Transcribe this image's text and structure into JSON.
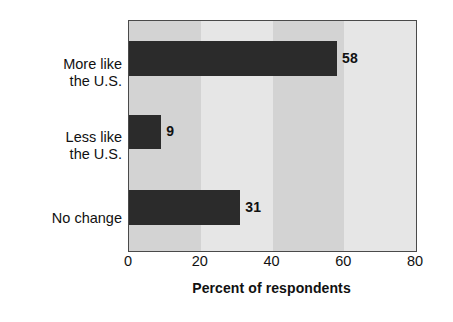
{
  "chart_data": {
    "type": "bar",
    "orientation": "horizontal",
    "title": "",
    "xlabel": "Percent of respondents",
    "ylabel": "",
    "xlim": [
      0,
      80
    ],
    "xticks": [
      0,
      20,
      40,
      60,
      80
    ],
    "xtick_labels": [
      "0",
      "20",
      "40",
      "60",
      "80"
    ],
    "grid": false,
    "banded_background": true,
    "legend": null,
    "categories": [
      "More like\nthe U.S.",
      "Less like\nthe U.S.",
      "No change"
    ],
    "values": [
      58,
      9,
      31
    ],
    "data_labels": [
      "58",
      "9",
      "31"
    ],
    "colors": {
      "bar": "#2b2b2b",
      "band_dark": "#d3d3d3",
      "band_light": "#e6e6e6",
      "frame": "#4a4a4a",
      "text": "#111111",
      "background": "#ffffff"
    }
  }
}
